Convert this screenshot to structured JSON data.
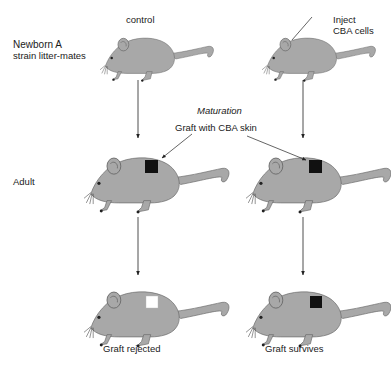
{
  "diagram": {
    "columns": {
      "left": {
        "header": "control"
      },
      "right": {
        "header": "Inject",
        "header_line2": "CBA cells"
      }
    },
    "rows": {
      "newborn": {
        "label_line1": "Newborn A",
        "label_line2": "strain litter-mates"
      },
      "adult": {
        "label": "Adult"
      }
    },
    "transition": {
      "label": "Maturation",
      "action": "Graft with CBA skin"
    },
    "outcomes": {
      "left": "Graft rejected",
      "right": "Graft survives"
    },
    "colors": {
      "mouse_fill": "#a8a8a8",
      "mouse_outline": "#6a6a6a",
      "graft_survived": "#111111",
      "graft_rejected": "#ffffff",
      "arrow": "#222222"
    }
  }
}
